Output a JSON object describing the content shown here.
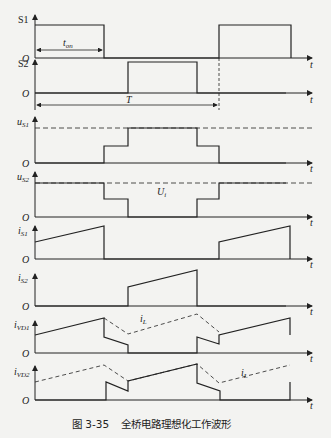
{
  "header": {
    "cut_off_text": "…"
  },
  "caption": {
    "figure_number": "图 3-35",
    "title": "全桥电路理想化工作波形"
  },
  "annotations": {
    "t_on": "t",
    "t_on_sub": "on",
    "period": "T",
    "ui": "U",
    "ui_sub": "i",
    "il": "i",
    "il_sub": "L",
    "time_axis": "t",
    "origin": "O"
  },
  "traces": [
    {
      "id": "S1",
      "label": "S1",
      "sub": ""
    },
    {
      "id": "S2",
      "label": "S2",
      "sub": ""
    },
    {
      "id": "uS1",
      "label": "u",
      "sub": "S1"
    },
    {
      "id": "uS2",
      "label": "u",
      "sub": "S2"
    },
    {
      "id": "iS1",
      "label": "i",
      "sub": "S1"
    },
    {
      "id": "iS2",
      "label": "i",
      "sub": "S2"
    },
    {
      "id": "iVD1",
      "label": "i",
      "sub": "VD1"
    },
    {
      "id": "iVD2",
      "label": "i",
      "sub": "VD2"
    }
  ],
  "colors": {
    "line": "#222222",
    "background": "#f3f3f1"
  }
}
